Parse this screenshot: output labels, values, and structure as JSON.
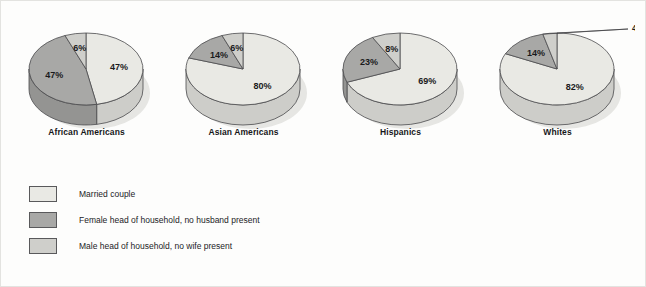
{
  "chart_data": {
    "type": "pie",
    "title": "",
    "subtitle": "",
    "xlabel": "",
    "ylabel": "",
    "legend_position": "bottom-left",
    "grid": false,
    "categories": [
      "Married couple",
      "Female head of household, no husband present",
      "Male head of household, no wife present"
    ],
    "colors": [
      "#e9e9e4",
      "#a8a8a6",
      "#cfcfcb"
    ],
    "charts": [
      {
        "name": "African Americans",
        "slices": [
          {
            "label": "47%",
            "value": 47,
            "category": "Married couple"
          },
          {
            "label": "47%",
            "value": 47,
            "category": "Female head of household, no husband present"
          },
          {
            "label": "6%",
            "value": 6,
            "category": "Male head of household, no wife present"
          }
        ]
      },
      {
        "name": "Asian Americans",
        "slices": [
          {
            "label": "80%",
            "value": 80,
            "category": "Married couple"
          },
          {
            "label": "14%",
            "value": 14,
            "category": "Female head of household, no husband present"
          },
          {
            "label": "6%",
            "value": 6,
            "category": "Male head of household, no wife present"
          }
        ]
      },
      {
        "name": "Hispanics",
        "slices": [
          {
            "label": "69%",
            "value": 69,
            "category": "Married couple"
          },
          {
            "label": "23%",
            "value": 23,
            "category": "Female head of household, no husband present"
          },
          {
            "label": "8%",
            "value": 8,
            "category": "Male head of household, no wife present"
          }
        ]
      },
      {
        "name": "Whites",
        "slices": [
          {
            "label": "82%",
            "value": 82,
            "category": "Married couple"
          },
          {
            "label": "14%",
            "value": 14,
            "category": "Female head of household, no husband present"
          },
          {
            "label": "4%",
            "value": 4,
            "category": "Male head of household, no wife present"
          }
        ]
      }
    ]
  },
  "legend": {
    "items": [
      {
        "label": "Married couple",
        "color": "#e9e9e4"
      },
      {
        "label": "Female head of household, no husband present",
        "color": "#a8a8a6"
      },
      {
        "label": "Male head of household, no wife present",
        "color": "#cfcfcb"
      }
    ]
  },
  "captions": {
    "chart0": "African Americans",
    "chart1": "Asian Americans",
    "chart2": "Hispanics",
    "chart3": "Whites"
  }
}
